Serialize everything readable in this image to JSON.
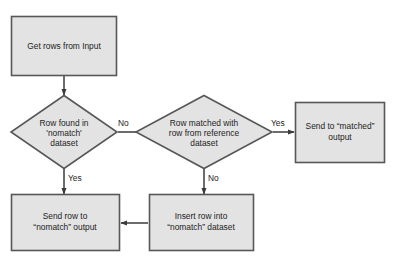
{
  "diagram": {
    "type": "flowchart",
    "colors": {
      "shape_fill": "#e3e3e3",
      "shape_border": "#575757",
      "connector": "#3b3b3b",
      "text": "#1d1d1d",
      "background": "#ffffff"
    },
    "nodes": [
      {
        "id": "get-rows",
        "kind": "process",
        "lines": [
          "Get rows from Input"
        ]
      },
      {
        "id": "row-found-nomatch",
        "kind": "decision",
        "lines": [
          "Row found in",
          "'nomatch'",
          "dataset"
        ]
      },
      {
        "id": "row-matched-reference",
        "kind": "decision",
        "lines": [
          "Row matched with",
          "row from reference",
          "dataset"
        ]
      },
      {
        "id": "send-matched",
        "kind": "process",
        "lines": [
          "Send to “matched”",
          "output"
        ]
      },
      {
        "id": "send-nomatch",
        "kind": "process",
        "lines": [
          "Send row to",
          "“nomatch” output"
        ]
      },
      {
        "id": "insert-nomatch",
        "kind": "process",
        "lines": [
          "Insert row into",
          "“nomatch” dataset"
        ]
      }
    ],
    "edges": [
      {
        "id": "get-rows-to-row-found",
        "from": "get-rows",
        "to": "row-found-nomatch",
        "label": ""
      },
      {
        "id": "row-found-no-to-row-matched",
        "from": "row-found-nomatch",
        "to": "row-matched-reference",
        "label": "No"
      },
      {
        "id": "row-found-yes-to-send-nomatch",
        "from": "row-found-nomatch",
        "to": "send-nomatch",
        "label": "Yes"
      },
      {
        "id": "row-matched-yes-to-send-matched",
        "from": "row-matched-reference",
        "to": "send-matched",
        "label": "Yes"
      },
      {
        "id": "row-matched-no-to-insert-nomatch",
        "from": "row-matched-reference",
        "to": "insert-nomatch",
        "label": "No"
      },
      {
        "id": "insert-nomatch-to-send-nomatch",
        "from": "insert-nomatch",
        "to": "send-nomatch",
        "label": ""
      }
    ]
  }
}
